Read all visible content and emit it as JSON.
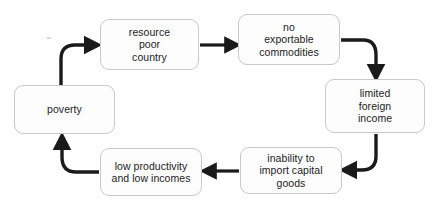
{
  "diagram": {
    "type": "cycle-flowchart",
    "canvas": {
      "width": 437,
      "height": 205,
      "background": "#ffffff"
    },
    "style": {
      "node_fill": "#fdfdfd",
      "node_border": "#c9c9c9",
      "arrow_color": "#1a1a1a",
      "text_color": "#1c1c1c"
    },
    "nodes": [
      {
        "id": "resource-poor-country",
        "label": "resource\npoor\ncountry",
        "lines": [
          "resource",
          "poor",
          "country"
        ]
      },
      {
        "id": "no-exportable-commodities",
        "label": "no\nexportable\ncommodities",
        "lines": [
          "no",
          "exportable",
          "commodities"
        ]
      },
      {
        "id": "limited-foreign-income",
        "label": "limited\nforeign\nincome",
        "lines": [
          "limited",
          "foreign",
          "income"
        ]
      },
      {
        "id": "inability-import-capital-goods",
        "label": "inability to\nimport capital\ngoods",
        "lines": [
          "inability to",
          "import capital",
          "goods"
        ]
      },
      {
        "id": "low-productivity-low-incomes",
        "label": "low productivity\nand low incomes",
        "lines": [
          "low productivity",
          "and low incomes"
        ]
      },
      {
        "id": "poverty",
        "label": "poverty",
        "lines": [
          "poverty"
        ]
      }
    ],
    "edges": [
      {
        "id": "edge-resource-to-commodities",
        "from": "resource-poor-country",
        "to": "no-exportable-commodities",
        "shape": "straight",
        "direction": "right"
      },
      {
        "id": "edge-commodities-to-income",
        "from": "no-exportable-commodities",
        "to": "limited-foreign-income",
        "shape": "curve",
        "direction": "down"
      },
      {
        "id": "edge-income-to-inability",
        "from": "limited-foreign-income",
        "to": "inability-import-capital-goods",
        "shape": "curve",
        "direction": "left"
      },
      {
        "id": "edge-inability-to-productivity",
        "from": "inability-import-capital-goods",
        "to": "low-productivity-low-incomes",
        "shape": "straight",
        "direction": "left"
      },
      {
        "id": "edge-productivity-to-poverty",
        "from": "low-productivity-low-incomes",
        "to": "poverty",
        "shape": "curve",
        "direction": "up"
      },
      {
        "id": "edge-poverty-to-resource",
        "from": "poverty",
        "to": "resource-poor-country",
        "shape": "curve",
        "direction": "right"
      }
    ]
  }
}
